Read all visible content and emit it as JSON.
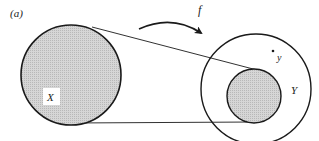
{
  "figure": {
    "panel_label": "(a)",
    "map_label": "f",
    "domain_set_label": "X",
    "codomain_set_label": "Y",
    "point_label": "y"
  },
  "colors": {
    "stroke": "#1a1a1a",
    "shade": "#cfcfcf",
    "background": "#ffffff"
  }
}
